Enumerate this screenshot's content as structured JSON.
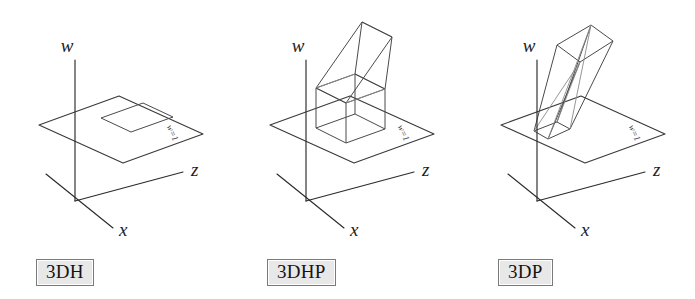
{
  "figure": {
    "background_color": "#ffffff",
    "line_color": "#3a3a3a",
    "caption_fill_color": "#e8e8e8",
    "caption_border_color": "#7a7a7a"
  },
  "panels": [
    {
      "id": "3dh",
      "caption": "3DH",
      "axes": {
        "w_label": "w",
        "z_label": "z",
        "x_label": "x"
      },
      "plane_label": "w=1",
      "shape_name": "flat-square-outline",
      "shape_description": "A flat square outline lying in the w=1 plane"
    },
    {
      "id": "3dhp",
      "caption": "3DHP",
      "axes": {
        "w_label": "w",
        "z_label": "z",
        "x_label": "x"
      },
      "plane_label": "w=1",
      "shape_name": "cube-with-slanted-prism",
      "shape_description": "A wireframe cube standing on the w=1 plane with a slanted open prism rising above it"
    },
    {
      "id": "3dp",
      "caption": "3DP",
      "axes": {
        "w_label": "w",
        "z_label": "z",
        "x_label": "x"
      },
      "plane_label": "w=1",
      "shape_name": "tilted-frustum",
      "shape_description": "A tilted elongated wireframe frustum piercing the w=1 plane"
    }
  ]
}
